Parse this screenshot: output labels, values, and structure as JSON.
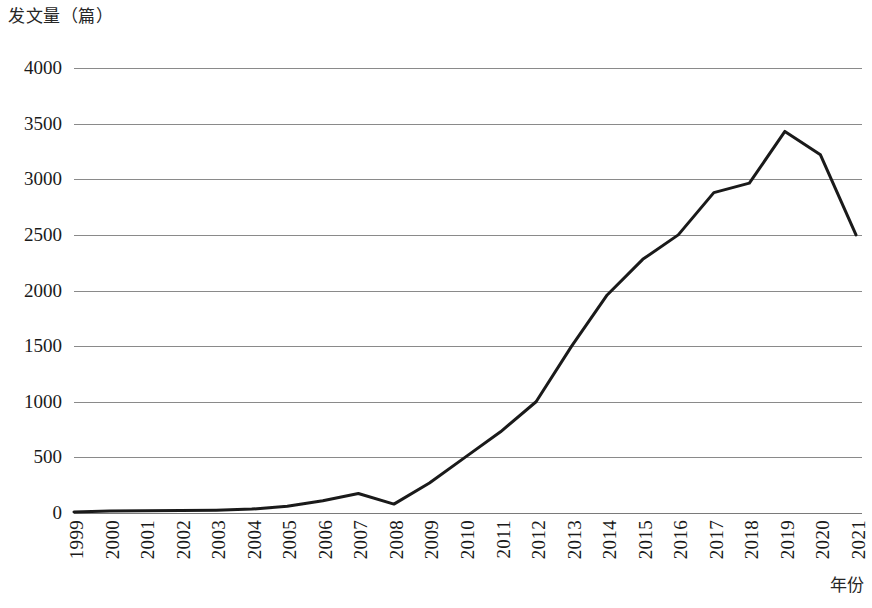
{
  "chart_data": {
    "type": "line",
    "title": "",
    "subtitle": "",
    "ylabel": "发文量（篇）",
    "xlabel": "年份",
    "grid": "horizontal",
    "legend": "none",
    "ylim": [
      0,
      4000
    ],
    "yticks": [
      0,
      500,
      1000,
      1500,
      2000,
      2500,
      3000,
      3500,
      4000
    ],
    "ytick_labels": [
      "0",
      "500",
      "1000",
      "1500",
      "2000",
      "2500",
      "3000",
      "3500",
      "4000"
    ],
    "categories": [
      "1999",
      "2000",
      "2001",
      "2002",
      "2003",
      "2004",
      "2005",
      "2006",
      "2007",
      "2008",
      "2009",
      "2010",
      "2011",
      "2012",
      "2013",
      "2014",
      "2015",
      "2016",
      "2017",
      "2018",
      "2019",
      "2020",
      "2021"
    ],
    "series": [
      {
        "name": "发文量",
        "color": "#1a1a1a",
        "values": [
          10,
          18,
          20,
          22,
          25,
          35,
          60,
          110,
          175,
          80,
          270,
          500,
          730,
          1000,
          1500,
          1960,
          2280,
          2500,
          2880,
          2965,
          3430,
          3220,
          2500
        ]
      }
    ]
  },
  "style": {
    "line_color": "#1a1a1a",
    "grid_color": "#8a8a8a",
    "background": "#ffffff",
    "text_color": "#1a1a1a"
  }
}
